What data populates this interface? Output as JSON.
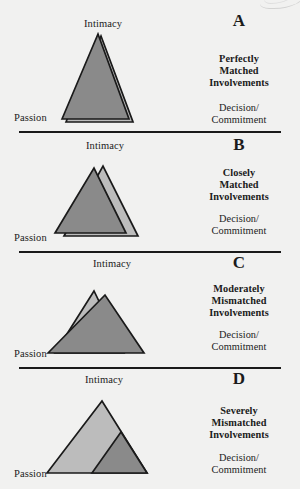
{
  "figure": {
    "background_color": "#f1f1f0",
    "ink_color": "#1a1a1a",
    "dark_fill": "#8a8a8a",
    "light_fill": "#bcbcbc",
    "artifact": "page-curl-arc"
  },
  "axis_labels": {
    "top": "Intimacy",
    "left": "Passion",
    "right_line1": "Decision/",
    "right_line2": "Commitment"
  },
  "panels": [
    {
      "letter": "A",
      "title_line1": "Perfectly",
      "title_line2": "Matched",
      "title_line3": "Involvements",
      "intimacy": "Intimacy",
      "passion": "Passion",
      "decision1": "Decision/",
      "decision2": "Commitment"
    },
    {
      "letter": "B",
      "title_line1": "Closely",
      "title_line2": "Matched",
      "title_line3": "Involvements",
      "intimacy": "Intimacy",
      "passion": "Passion",
      "decision1": "Decision/",
      "decision2": "Commitment"
    },
    {
      "letter": "C",
      "title_line1": "Moderately",
      "title_line2": "Mismatched",
      "title_line3": "Involvements",
      "intimacy": "Intimacy",
      "passion": "Passion",
      "decision1": "Decision/",
      "decision2": "Commitment"
    },
    {
      "letter": "D",
      "title_line1": "Severely",
      "title_line2": "Mismatched",
      "title_line3": "Involvements",
      "intimacy": "Intimacy",
      "passion": "Passion",
      "decision1": "Decision/",
      "decision2": "Commitment"
    }
  ],
  "chart_data": {
    "type": "diagram",
    "vertex_labels": [
      "Intimacy",
      "Passion",
      "Decision/Commitment"
    ],
    "panels": [
      {
        "letter": "A",
        "label": "Perfectly Matched Involvements",
        "overlap": "near total",
        "triangles": [
          {
            "name": "partner-1",
            "fill": "#bcbcbc",
            "points": "52,96 87,10 119,96"
          },
          {
            "name": "partner-2",
            "fill": "#8a8a8a",
            "points": "48,93 84,8 115,93"
          }
        ]
      },
      {
        "letter": "B",
        "label": "Closely Matched Involvements",
        "overlap": "large",
        "triangles": [
          {
            "name": "partner-1",
            "fill": "#bcbcbc",
            "points": "50,84 89,14 124,84"
          },
          {
            "name": "partner-2",
            "fill": "#8a8a8a",
            "points": "41,81 80,16 112,81"
          }
        ]
      },
      {
        "letter": "C",
        "label": "Moderately Mismatched Involvements",
        "overlap": "moderate",
        "triangles": [
          {
            "name": "partner-1",
            "fill": "#bcbcbc",
            "points": "41,81 80,19 110,81"
          },
          {
            "name": "partner-2",
            "fill": "#8a8a8a",
            "points": "34,81 91,23 130,81"
          }
        ]
      },
      {
        "letter": "D",
        "label": "Severely Mismatched Involvements",
        "overlap": "small",
        "triangles": [
          {
            "name": "partner-1",
            "fill": "#bcbcbc",
            "points": "33,85 88,13 133,85"
          },
          {
            "name": "partner-2",
            "fill": "#8a8a8a",
            "points": "78,85 107,44 133,85"
          }
        ]
      }
    ]
  }
}
